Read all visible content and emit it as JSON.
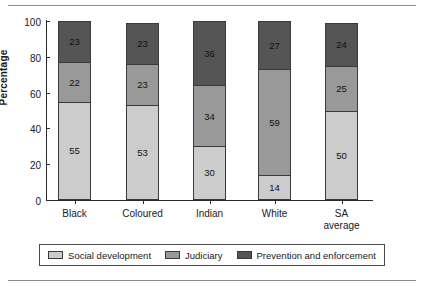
{
  "chart_data": {
    "type": "bar",
    "subtype": "stacked-bar-100",
    "title": "",
    "xlabel": "",
    "ylabel": "Percentage",
    "ylim": [
      0,
      100
    ],
    "yticks": [
      0,
      20,
      40,
      60,
      80,
      100
    ],
    "ytick_labels": [
      "0",
      "20",
      "40",
      "60",
      "80",
      "100"
    ],
    "grid": false,
    "legend_position": "bottom",
    "categories": [
      "Black",
      "Coloured",
      "Indian",
      "White",
      "SA average"
    ],
    "series": [
      {
        "name": "Social development",
        "color": "#cccccc",
        "values": [
          55,
          53,
          30,
          14,
          50
        ]
      },
      {
        "name": "Judiciary",
        "color": "#999999",
        "values": [
          22,
          23,
          34,
          59,
          25
        ]
      },
      {
        "name": "Prevention and enforcement",
        "color": "#555555",
        "values": [
          23,
          23,
          36,
          27,
          24
        ]
      }
    ]
  },
  "axis": {
    "y_label": "Percentage",
    "y_ticks": [
      {
        "value": 100,
        "label": "100"
      },
      {
        "value": 80,
        "label": "80"
      },
      {
        "value": 60,
        "label": "60"
      },
      {
        "value": 40,
        "label": "40"
      },
      {
        "value": 20,
        "label": "20"
      },
      {
        "value": 0,
        "label": "0"
      }
    ]
  },
  "bars": [
    {
      "category": "Black",
      "label_line1": "Black",
      "label_line2": "",
      "segments": [
        {
          "series": "Prevention and enforcement",
          "value": 23,
          "label": "23"
        },
        {
          "series": "Judiciary",
          "value": 22,
          "label": "22"
        },
        {
          "series": "Social development",
          "value": 55,
          "label": "55"
        }
      ]
    },
    {
      "category": "Coloured",
      "label_line1": "Coloured",
      "label_line2": "",
      "segments": [
        {
          "series": "Prevention and enforcement",
          "value": 23,
          "label": "23"
        },
        {
          "series": "Judiciary",
          "value": 23,
          "label": "23"
        },
        {
          "series": "Social development",
          "value": 53,
          "label": "53"
        }
      ]
    },
    {
      "category": "Indian",
      "label_line1": "Indian",
      "label_line2": "",
      "segments": [
        {
          "series": "Prevention and enforcement",
          "value": 36,
          "label": "36"
        },
        {
          "series": "Judiciary",
          "value": 34,
          "label": "34"
        },
        {
          "series": "Social development",
          "value": 30,
          "label": "30"
        }
      ]
    },
    {
      "category": "White",
      "label_line1": "White",
      "label_line2": "",
      "segments": [
        {
          "series": "Prevention and enforcement",
          "value": 27,
          "label": "27"
        },
        {
          "series": "Judiciary",
          "value": 59,
          "label": "59"
        },
        {
          "series": "Social development",
          "value": 14,
          "label": "14"
        }
      ]
    },
    {
      "category": "SA average",
      "label_line1": "SA",
      "label_line2": "average",
      "segments": [
        {
          "series": "Prevention and enforcement",
          "value": 24,
          "label": "24"
        },
        {
          "series": "Judiciary",
          "value": 25,
          "label": "25"
        },
        {
          "series": "Social development",
          "value": 50,
          "label": "50"
        }
      ]
    }
  ],
  "legend": {
    "items": [
      {
        "label": "Social development",
        "color": "#cccccc"
      },
      {
        "label": "Judiciary",
        "color": "#999999"
      },
      {
        "label": "Prevention and enforcement",
        "color": "#555555"
      }
    ]
  },
  "colors": {
    "social_development": "#cccccc",
    "judiciary": "#999999",
    "prevention_and_enforcement": "#555555",
    "axis": "#2b2b2b",
    "outline": "#3a3a3a",
    "rule": "#8d8d8d"
  }
}
